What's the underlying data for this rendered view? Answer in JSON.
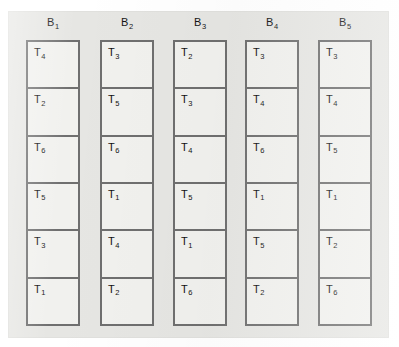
{
  "figure": {
    "type": "randomized-complete-block-design-diagram",
    "panel_color": "#e6e6e3",
    "cell_color": "#f1f1ee",
    "border_color": "#6f6f6f",
    "text_color": "#121212",
    "rows_per_block": 6,
    "block_count": 5
  },
  "blocks": [
    {
      "label": "B",
      "subscript": "1",
      "cells": [
        {
          "label": "T",
          "subscript": "4"
        },
        {
          "label": "T",
          "subscript": "2"
        },
        {
          "label": "T",
          "subscript": "6"
        },
        {
          "label": "T",
          "subscript": "5"
        },
        {
          "label": "T",
          "subscript": "3"
        },
        {
          "label": "T",
          "subscript": "1"
        }
      ]
    },
    {
      "label": "B",
      "subscript": "2",
      "cells": [
        {
          "label": "T",
          "subscript": "3"
        },
        {
          "label": "T",
          "subscript": "5"
        },
        {
          "label": "T",
          "subscript": "6"
        },
        {
          "label": "T",
          "subscript": "1"
        },
        {
          "label": "T",
          "subscript": "4"
        },
        {
          "label": "T",
          "subscript": "2"
        }
      ]
    },
    {
      "label": "B",
      "subscript": "3",
      "cells": [
        {
          "label": "T",
          "subscript": "2"
        },
        {
          "label": "T",
          "subscript": "3"
        },
        {
          "label": "T",
          "subscript": "4"
        },
        {
          "label": "T",
          "subscript": "5"
        },
        {
          "label": "T",
          "subscript": "1"
        },
        {
          "label": "T",
          "subscript": "6"
        }
      ]
    },
    {
      "label": "B",
      "subscript": "4",
      "cells": [
        {
          "label": "T",
          "subscript": "3"
        },
        {
          "label": "T",
          "subscript": "4"
        },
        {
          "label": "T",
          "subscript": "6"
        },
        {
          "label": "T",
          "subscript": "1"
        },
        {
          "label": "T",
          "subscript": "5"
        },
        {
          "label": "T",
          "subscript": "2"
        }
      ]
    },
    {
      "label": "B",
      "subscript": "5",
      "cells": [
        {
          "label": "T",
          "subscript": "3"
        },
        {
          "label": "T",
          "subscript": "4"
        },
        {
          "label": "T",
          "subscript": "5"
        },
        {
          "label": "T",
          "subscript": "1"
        },
        {
          "label": "T",
          "subscript": "2"
        },
        {
          "label": "T",
          "subscript": "6"
        }
      ]
    }
  ]
}
